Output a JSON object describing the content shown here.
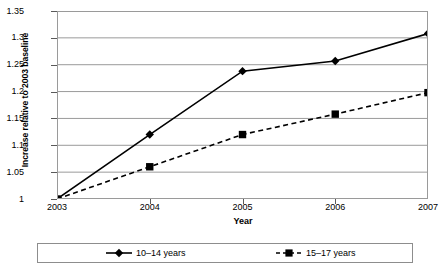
{
  "chart_data": {
    "type": "line",
    "title": "",
    "xlabel": "Year",
    "ylabel": "Increase relative to 2003 baseline",
    "categories": [
      "2003",
      "2004",
      "2005",
      "2006",
      "2007"
    ],
    "x": [
      2003,
      2004,
      2005,
      2006,
      2007
    ],
    "series": [
      {
        "name": "10–14 years",
        "values": [
          1,
          1.12,
          1.238,
          1.257,
          1.308
        ],
        "marker": "diamond",
        "line_style": "solid",
        "color": "#000000"
      },
      {
        "name": "15–17 years",
        "values": [
          1,
          1.06,
          1.12,
          1.158,
          1.198
        ],
        "marker": "square",
        "line_style": "dashed",
        "color": "#000000"
      }
    ],
    "ylim": [
      1,
      1.35
    ],
    "ytick_labels": [
      "1",
      "1.05",
      "1.1",
      "1.15",
      "1.2",
      "1.25",
      "1.3",
      "1.35"
    ],
    "ytick_values": [
      1,
      1.05,
      1.1,
      1.15,
      1.2,
      1.25,
      1.3,
      1.35
    ],
    "xtick_labels": [
      "2003",
      "2004",
      "2005",
      "2006",
      "2007"
    ],
    "grid": "horizontal",
    "grid_color": "#9a9a9a",
    "legend_position": "bottom",
    "background_color": "#ffffff",
    "plot_border_color": "#9a9a9a"
  },
  "legend": {
    "entries": [
      {
        "label": "10–14 years"
      },
      {
        "label": "15–17 years"
      }
    ]
  }
}
